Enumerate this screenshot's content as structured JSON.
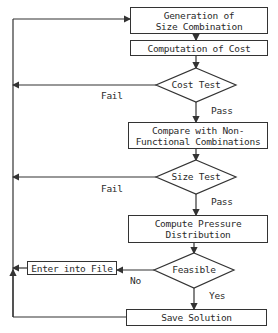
{
  "diagram": {
    "type": "flowchart",
    "nodes": {
      "generation": {
        "line1": "Generation of",
        "line2": "Size Combination"
      },
      "cost": {
        "label": "Computation of Cost"
      },
      "cost_test": {
        "label": "Cost Test"
      },
      "compare": {
        "line1": "Compare with Non-",
        "line2": "Functional Combinations"
      },
      "size_test": {
        "label": "Size Test"
      },
      "pressure": {
        "line1": "Compute Pressure",
        "line2": "Distribution"
      },
      "feasible": {
        "label": "Feasible"
      },
      "enter_file": {
        "label": "Enter into File"
      },
      "save": {
        "label": "Save Solution"
      }
    },
    "edges": {
      "cost_fail": "Fail",
      "cost_pass": "Pass",
      "size_fail": "Fail",
      "size_pass": "Pass",
      "feasible_no": "No",
      "feasible_yes": "Yes"
    },
    "colors": {
      "line": "#333333",
      "background": "#ffffff"
    }
  }
}
